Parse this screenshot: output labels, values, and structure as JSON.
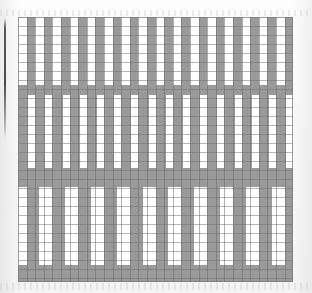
{
  "figure": {
    "title": "Vertical stripe grid pattern",
    "type": "grid-stripe-pattern",
    "width": 312,
    "height": 293,
    "background_color": "#ffffff",
    "stripe_color": "#9a9a9a",
    "grid_line_color": "#6e6e6e",
    "plate_border_color": "#787878",
    "gutter_rule_color": "#282828"
  },
  "chart_data": {
    "type": "heatmap",
    "title": "Vertical stripe grid pattern",
    "xlabel": "",
    "ylabel": "",
    "grid": true,
    "legend": "none",
    "cell_width": 8.6,
    "cell_height": 9.0,
    "plate": {
      "x": 18,
      "y": 17,
      "width": 275,
      "height": 265
    },
    "colors": {
      "on": "#9a9a9a",
      "off": "#ffffff"
    },
    "bands": [
      {
        "name": "band-1",
        "y": 17,
        "height": 68,
        "fill": "off",
        "stripe_period": 17.2,
        "stripe_width": 8.6,
        "stripe_offset": 8.6,
        "stripe_count": 16,
        "description": "narrow alternating gray/white stripes, 50% duty"
      },
      {
        "name": "rule-row-1",
        "y": 85,
        "height": 10,
        "fill": "on",
        "stripe_period": 0,
        "stripe_width": 0,
        "stripe_offset": 0,
        "stripe_count": 0,
        "description": "solid gray full-width separator row"
      },
      {
        "name": "band-2",
        "y": 95,
        "height": 73,
        "fill": "off",
        "stripe_period": 17.2,
        "stripe_width": 10.3,
        "stripe_offset": 0,
        "stripe_count": 17,
        "description": "gray-dominant stripes, phase shifted half a cell from band 1"
      },
      {
        "name": "rule-row-2",
        "y": 168,
        "height": 19,
        "fill": "on",
        "stripe_period": 0,
        "stripe_width": 0,
        "stripe_offset": 0,
        "stripe_count": 0,
        "description": "solid gray full-width separator, two rows tall"
      },
      {
        "name": "band-3",
        "y": 187,
        "height": 78,
        "fill": "off",
        "stripe_period": 25.8,
        "stripe_width": 12.9,
        "stripe_offset": 8.6,
        "stripe_count": 11,
        "description": "wider gray columns with wide white gaps, lower frequency"
      },
      {
        "name": "rule-row-3",
        "y": 265,
        "height": 17,
        "fill": "on",
        "stripe_period": 0,
        "stripe_width": 0,
        "stripe_offset": 0,
        "stripe_count": 0,
        "description": "solid gray full-width bottom separator row"
      }
    ],
    "ruling": {
      "vertical_pitch": 8.6,
      "vertical_count": 32,
      "horizontal_pitch": 9.0,
      "horizontal_count": 30
    }
  },
  "gutter_rule": {
    "x": 4,
    "y": 18,
    "width": 2,
    "height": 120
  },
  "noise_bands": [
    {
      "y": 10,
      "height": 6
    },
    {
      "y": 283,
      "height": 7
    }
  ]
}
